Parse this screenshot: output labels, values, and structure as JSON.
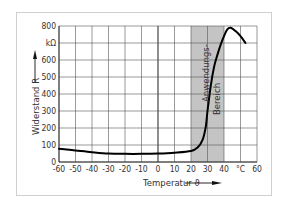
{
  "chart_data": {
    "type": "line",
    "title": "",
    "xlabel": "Temperatur ϑ",
    "ylabel": "Widerstand R",
    "x_unit": "°C",
    "y_unit": "kΩ",
    "xlim": [
      -60,
      60
    ],
    "ylim": [
      0,
      800
    ],
    "x_ticks": [
      "-60",
      "-50",
      "-40",
      "-30",
      "-20",
      "-10",
      "0",
      "10",
      "20",
      "30",
      "40",
      "°C",
      "60"
    ],
    "y_ticks": [
      "0",
      "100",
      "200",
      "300",
      "400",
      "500",
      "kΩ",
      "600",
      "700",
      "800"
    ],
    "y_tick_labels_shown": [
      "0",
      "100",
      "200",
      "300",
      "400",
      "500",
      "600",
      "kΩ",
      "800"
    ],
    "grid": true,
    "legend": null,
    "shaded_region": {
      "label_line1": "Anwendungs-",
      "label_line2": "Bereich",
      "x_from": 20,
      "x_to": 40
    },
    "series": [
      {
        "name": "Widerstand R",
        "x": [
          -60,
          -50,
          -40,
          -30,
          -20,
          -10,
          0,
          10,
          20,
          24,
          27,
          29,
          30,
          32,
          34,
          36,
          38,
          40,
          42,
          44,
          47,
          50,
          53
        ],
        "values": [
          78,
          68,
          58,
          50,
          48,
          48,
          50,
          55,
          65,
          85,
          130,
          210,
          300,
          450,
          560,
          630,
          690,
          740,
          780,
          790,
          770,
          740,
          700
        ]
      }
    ]
  },
  "labels": {
    "ylabel": "Widerstand R",
    "xlabel": "Temperatur ϑ",
    "region_line1": "Anwendungs-",
    "region_line2": "Bereich"
  }
}
